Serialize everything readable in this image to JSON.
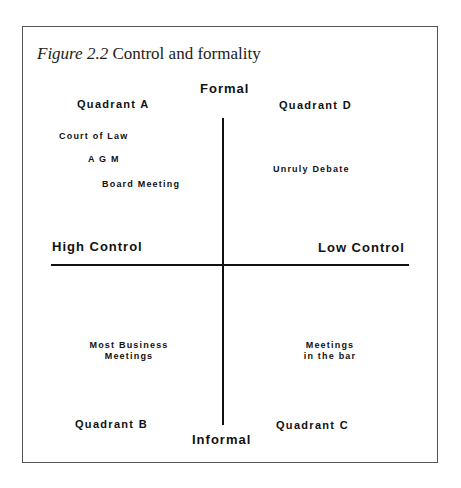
{
  "figure": {
    "label": "Figure 2.2",
    "title": "Control and formality"
  },
  "axes": {
    "top": "Formal",
    "bottom": "Informal",
    "left": "High Control",
    "right": "Low Control"
  },
  "quadrants": {
    "a": {
      "label": "Quadrant A",
      "items": [
        "Court of Law",
        "A G M",
        "Board Meeting"
      ]
    },
    "b": {
      "label": "Quadrant B",
      "items": [
        "Most Business",
        "Meetings"
      ]
    },
    "c": {
      "label": "Quadrant C",
      "items": [
        "Meetings",
        "in the bar"
      ]
    },
    "d": {
      "label": "Quadrant D",
      "items": [
        "Unruly Debate"
      ]
    }
  }
}
